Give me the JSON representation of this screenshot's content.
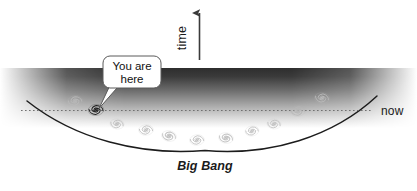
{
  "figure": {
    "background_color": "#ffffff",
    "width": 417,
    "height": 191
  },
  "axis": {
    "time_label": "time",
    "time_label_rotation": -90,
    "arrow_direction": "up",
    "arrow_color": "#3b3b3b"
  },
  "annotations": {
    "now_label": "now",
    "big_bang_label": "Big Bang",
    "callout_line_1": "You are here",
    "callout_line_2": "You are",
    "callout_line_3": "here",
    "callout_target": "milky-way-galaxy"
  },
  "curve": {
    "name": "big-bang-light-cone",
    "stroke_color": "#1c1c1c",
    "stroke_width": 1.5,
    "vertex_x": 205,
    "vertex_y": 150,
    "left_end_x": 27,
    "left_end_y": 101,
    "right_end_x": 377,
    "right_end_y": 96
  },
  "now_line": {
    "name": "now-dotted-line",
    "style": "dotted",
    "color": "#6b6b6b",
    "y": 110,
    "x_start": 21,
    "x_end": 371
  },
  "gradient_band": {
    "name": "cosmic-background-gradient",
    "top_color": "#343434",
    "bottom_color": "#ffffff",
    "top_y": 68,
    "bottom_y": 128
  },
  "galaxies": [
    {
      "id": "galaxy-1",
      "x": 75,
      "y": 101,
      "r": 7.5,
      "color": "#b9b9b9",
      "highlight": false
    },
    {
      "id": "galaxy-2",
      "x": 96,
      "y": 110,
      "r": 8.0,
      "color": "#111111",
      "highlight": true
    },
    {
      "id": "galaxy-3",
      "x": 117,
      "y": 124,
      "r": 7.0,
      "color": "#bcbcbc",
      "highlight": false
    },
    {
      "id": "galaxy-4",
      "x": 146,
      "y": 130,
      "r": 7.5,
      "color": "#bdbdbd",
      "highlight": false
    },
    {
      "id": "galaxy-5",
      "x": 169,
      "y": 136,
      "r": 7.5,
      "color": "#bbbbbb",
      "highlight": false
    },
    {
      "id": "galaxy-6",
      "x": 197,
      "y": 140,
      "r": 7.5,
      "color": "#bebebe",
      "highlight": false
    },
    {
      "id": "galaxy-7",
      "x": 226,
      "y": 138,
      "r": 7.5,
      "color": "#bdbdbd",
      "highlight": false
    },
    {
      "id": "galaxy-8",
      "x": 252,
      "y": 131,
      "r": 7.0,
      "color": "#bfbfbf",
      "highlight": false
    },
    {
      "id": "galaxy-9",
      "x": 274,
      "y": 124,
      "r": 7.0,
      "color": "#bdbdbd",
      "highlight": false
    },
    {
      "id": "galaxy-10",
      "x": 298,
      "y": 111,
      "r": 7.5,
      "color": "#b6b6b6",
      "highlight": false
    },
    {
      "id": "galaxy-11",
      "x": 322,
      "y": 98,
      "r": 7.5,
      "color": "#bbbbbb",
      "highlight": false
    }
  ],
  "callout_bubble": {
    "name": "you-are-here-callout",
    "fill": "#ffffff",
    "stroke": "#5a5a5a",
    "x": 103,
    "y": 56,
    "width": 58,
    "height": 32,
    "tail_tip_x": 99,
    "tail_tip_y": 108
  }
}
